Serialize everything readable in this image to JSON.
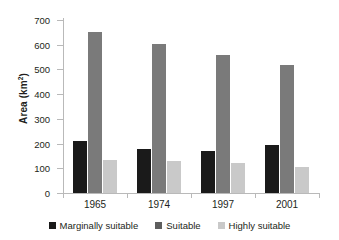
{
  "chart_data": {
    "type": "bar",
    "title": "",
    "xlabel": "",
    "ylabel": "Area (km2)",
    "ylabel_base": "Area (km",
    "ylabel_sup": "2",
    "ylabel_close": ")",
    "categories": [
      "1965",
      "1974",
      "1997",
      "2001"
    ],
    "ylim": [
      0,
      700
    ],
    "ytick_step": 100,
    "yticks": [
      "0",
      "100",
      "200",
      "300",
      "400",
      "500",
      "600",
      "700"
    ],
    "grid": false,
    "legend_position": "bottom",
    "series": [
      {
        "name": "Marginally suitable",
        "color": "#1a1a1a",
        "values": [
          210,
          179,
          168,
          195
        ]
      },
      {
        "name": "Suitable",
        "color": "#7a7a7a",
        "values": [
          652,
          604,
          559,
          516
        ]
      },
      {
        "name": "Highly suitable",
        "color": "#c9c9c9",
        "values": [
          133,
          131,
          120,
          107
        ]
      }
    ]
  },
  "colors": {
    "axis": "#b9b9b9",
    "text": "#231f20",
    "background": "#ffffff",
    "marginally_suitable": "#1a1a1a",
    "suitable": "#7a7a7a",
    "highly_suitable": "#c9c9c9"
  }
}
